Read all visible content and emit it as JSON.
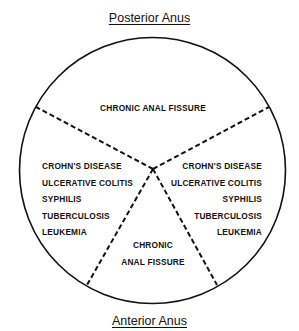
{
  "diagram": {
    "top_label": "Posterior Anus",
    "bottom_label": "Anterior Anus",
    "sectors": {
      "top": {
        "lines": [
          "CHRONIC ANAL FISSURE"
        ]
      },
      "left": {
        "lines": [
          "CROHN'S DISEASE",
          "ULCERATIVE COLITIS",
          "SYPHILIS",
          "TUBERCULOSIS",
          "LEUKEMIA"
        ]
      },
      "right": {
        "lines": [
          "CROHN'S DISEASE",
          "ULCERATIVE COLITIS",
          "SYPHILIS",
          "TUBERCULOSIS",
          "LEUKEMIA"
        ]
      },
      "bottom": {
        "lines": [
          "CHRONIC",
          "ANAL FISSURE"
        ]
      }
    },
    "colors": {
      "stroke": "#111111",
      "background": "#ffffff"
    }
  }
}
